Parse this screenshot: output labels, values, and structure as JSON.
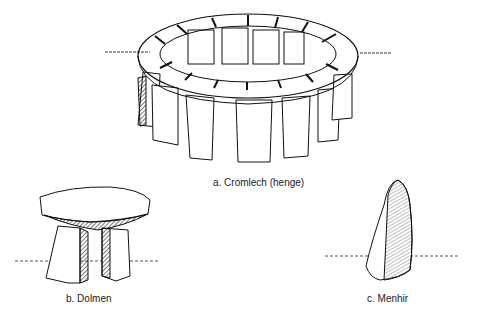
{
  "figures": [
    {
      "id": "a",
      "label": "a. Cromlech (henge)"
    },
    {
      "id": "b",
      "label": "b. Dolmen"
    },
    {
      "id": "c",
      "label": "c. Menhir"
    }
  ]
}
